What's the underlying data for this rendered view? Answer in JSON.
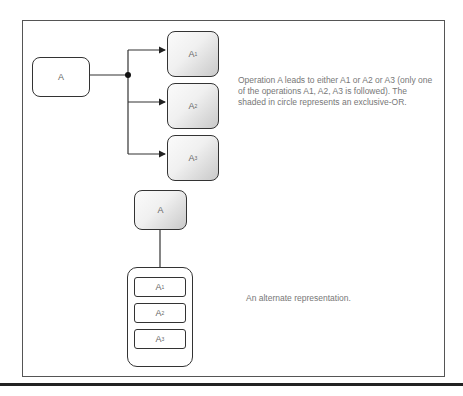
{
  "diagram": {
    "top": {
      "source": {
        "label": "A"
      },
      "targets": [
        {
          "label": "A1"
        },
        {
          "label": "A2"
        },
        {
          "label": "A3"
        }
      ],
      "junction": "exclusive-or-dot",
      "description": "Operation A leads to either A1 or A2 or A3 (only one of the operations A1, A2, A3 is followed). The shaded in circle represents an exclusive-OR."
    },
    "bottom": {
      "source": {
        "label": "A"
      },
      "group": [
        {
          "label": "A1"
        },
        {
          "label": "A2"
        },
        {
          "label": "A3"
        }
      ],
      "description": "An alternate representation."
    }
  }
}
